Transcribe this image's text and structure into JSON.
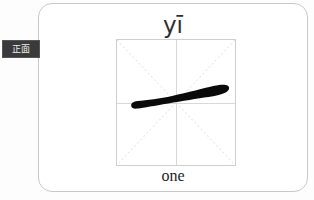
{
  "canvas": {
    "width": 314,
    "height": 200,
    "background_color": "#fdfdfd"
  },
  "side_tab": {
    "label": "正面",
    "meaning": "front side",
    "background_color": "#3a3a3a",
    "text_color": "#ededed"
  },
  "card": {
    "background_color": "#ffffff",
    "border_color": "#c9c9c9",
    "pinyin": "yī",
    "gloss": "one",
    "character": "一",
    "grid": {
      "type": "mi-zi-ge",
      "border_color": "#cfcfcf",
      "center_line_color": "#d8d8d8",
      "diagonal_line_color": "#dcdcdc",
      "diagonal_style": "dotted"
    },
    "stroke": {
      "name": "heng",
      "count": 1,
      "color": "#0a0a0a"
    }
  }
}
